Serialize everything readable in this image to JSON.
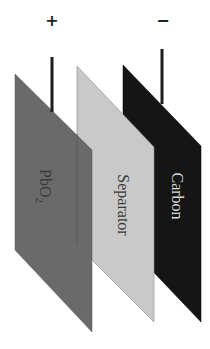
{
  "diagram": {
    "type": "battery-electrode-stack",
    "terminals": {
      "positive": {
        "symbol": "+",
        "x": 52,
        "line_top": 57,
        "line_bottom": 112
      },
      "negative": {
        "symbol": "−",
        "x": 162,
        "line_top": 49,
        "line_bottom": 104
      }
    },
    "plates": [
      {
        "id": "carbon",
        "label": "Carbon",
        "fill": "#151515",
        "text_color": "#d8d8d8",
        "points": "123,65 201,146 201,322 123,240"
      },
      {
        "id": "separator",
        "label": "Separator",
        "fill": "#c9c9c9",
        "text_color": "#3a3a3a",
        "points": "77,66 154,147 154,322 77,245"
      },
      {
        "id": "pbo2",
        "label": "PbO",
        "label_subscript": "2",
        "fill": "#6a6a6a",
        "text_color": "#3a3a3a",
        "points": "15,74 92,150 92,332 15,250"
      }
    ],
    "colors": {
      "terminal_line": "#1e1e1e",
      "background": "#ffffff"
    }
  }
}
